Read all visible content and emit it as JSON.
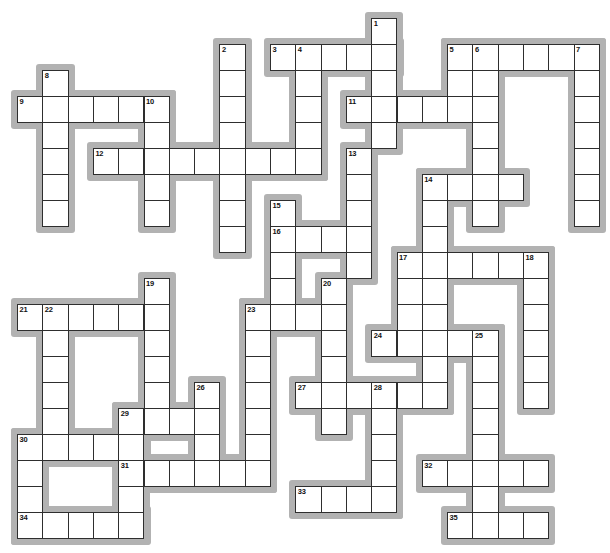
{
  "puzzle": {
    "kind": "crossword-grid",
    "grid": {
      "columns": 23,
      "rows": 20,
      "origin_x": 17,
      "origin_y": 18,
      "cell_width": 25.3,
      "cell_height": 26,
      "shadow_margin": 6,
      "colors": {
        "background": "#ffffff",
        "cell_fill": "#ffffff",
        "cell_border": "#2e2e2e",
        "run_shadow": "#b2b2b2",
        "number_text": "#111111"
      }
    },
    "words": [
      {
        "number": 3,
        "direction": "across",
        "col": 10,
        "row": 1,
        "length": 5
      },
      {
        "number": 5,
        "direction": "across",
        "col": 17,
        "row": 1,
        "length": 6
      },
      {
        "number": 9,
        "direction": "across",
        "col": 0,
        "row": 3,
        "length": 6
      },
      {
        "number": 11,
        "direction": "across",
        "col": 13,
        "row": 3,
        "length": 5
      },
      {
        "number": 12,
        "direction": "across",
        "col": 3,
        "row": 5,
        "length": 9
      },
      {
        "number": 14,
        "direction": "across",
        "col": 16,
        "row": 6,
        "length": 4
      },
      {
        "number": 16,
        "direction": "across",
        "col": 10,
        "row": 8,
        "length": 4
      },
      {
        "number": 17,
        "direction": "across",
        "col": 15,
        "row": 9,
        "length": 6
      },
      {
        "number": 21,
        "direction": "across",
        "col": 0,
        "row": 11,
        "length": 6
      },
      {
        "number": 23,
        "direction": "across",
        "col": 9,
        "row": 11,
        "length": 4
      },
      {
        "number": 24,
        "direction": "across",
        "col": 14,
        "row": 12,
        "length": 5
      },
      {
        "number": 27,
        "direction": "across",
        "col": 11,
        "row": 14,
        "length": 6
      },
      {
        "number": 29,
        "direction": "across",
        "col": 4,
        "row": 15,
        "length": 4
      },
      {
        "number": 30,
        "direction": "across",
        "col": 0,
        "row": 16,
        "length": 5
      },
      {
        "number": 31,
        "direction": "across",
        "col": 4,
        "row": 17,
        "length": 6
      },
      {
        "number": 32,
        "direction": "across",
        "col": 16,
        "row": 17,
        "length": 5
      },
      {
        "number": 33,
        "direction": "across",
        "col": 11,
        "row": 18,
        "length": 4
      },
      {
        "number": 34,
        "direction": "across",
        "col": 0,
        "row": 19,
        "length": 5
      },
      {
        "number": 35,
        "direction": "across",
        "col": 17,
        "row": 19,
        "length": 4
      },
      {
        "number": 1,
        "direction": "down",
        "col": 14,
        "row": 0,
        "length": 5
      },
      {
        "number": 2,
        "direction": "down",
        "col": 8,
        "row": 1,
        "length": 8
      },
      {
        "number": 4,
        "direction": "down",
        "col": 11,
        "row": 1,
        "length": 5
      },
      {
        "number": 5,
        "direction": "down",
        "col": 17,
        "row": 1,
        "length": 3
      },
      {
        "number": 6,
        "direction": "down",
        "col": 18,
        "row": 1,
        "length": 7
      },
      {
        "number": 7,
        "direction": "down",
        "col": 22,
        "row": 1,
        "length": 7
      },
      {
        "number": 8,
        "direction": "down",
        "col": 1,
        "row": 2,
        "length": 6
      },
      {
        "number": 10,
        "direction": "down",
        "col": 5,
        "row": 3,
        "length": 5
      },
      {
        "number": 13,
        "direction": "down",
        "col": 13,
        "row": 5,
        "length": 5
      },
      {
        "number": 14,
        "direction": "down",
        "col": 16,
        "row": 6,
        "length": 9
      },
      {
        "number": 15,
        "direction": "down",
        "col": 10,
        "row": 7,
        "length": 5
      },
      {
        "number": 17,
        "direction": "down",
        "col": 15,
        "row": 9,
        "length": 4
      },
      {
        "number": 18,
        "direction": "down",
        "col": 20,
        "row": 9,
        "length": 6
      },
      {
        "number": 19,
        "direction": "down",
        "col": 5,
        "row": 10,
        "length": 6
      },
      {
        "number": 20,
        "direction": "down",
        "col": 12,
        "row": 10,
        "length": 6
      },
      {
        "number": 22,
        "direction": "down",
        "col": 1,
        "row": 11,
        "length": 6
      },
      {
        "number": 23,
        "direction": "down",
        "col": 9,
        "row": 11,
        "length": 7
      },
      {
        "number": 25,
        "direction": "down",
        "col": 18,
        "row": 12,
        "length": 8
      },
      {
        "number": 26,
        "direction": "down",
        "col": 7,
        "row": 14,
        "length": 4
      },
      {
        "number": 28,
        "direction": "down",
        "col": 14,
        "row": 14,
        "length": 5
      },
      {
        "number": 29,
        "direction": "down",
        "col": 4,
        "row": 15,
        "length": 5
      },
      {
        "number": 30,
        "direction": "down",
        "col": 0,
        "row": 16,
        "length": 4
      }
    ],
    "numbers": [
      {
        "label": "1",
        "col": 14,
        "row": 0
      },
      {
        "label": "2",
        "col": 8,
        "row": 1
      },
      {
        "label": "3",
        "col": 10,
        "row": 1
      },
      {
        "label": "4",
        "col": 11,
        "row": 1
      },
      {
        "label": "5",
        "col": 17,
        "row": 1
      },
      {
        "label": "6",
        "col": 18,
        "row": 1
      },
      {
        "label": "7",
        "col": 22,
        "row": 1
      },
      {
        "label": "8",
        "col": 1,
        "row": 2
      },
      {
        "label": "9",
        "col": 0,
        "row": 3
      },
      {
        "label": "10",
        "col": 5,
        "row": 3
      },
      {
        "label": "11",
        "col": 13,
        "row": 3
      },
      {
        "label": "12",
        "col": 3,
        "row": 5
      },
      {
        "label": "13",
        "col": 13,
        "row": 5
      },
      {
        "label": "14",
        "col": 16,
        "row": 6
      },
      {
        "label": "15",
        "col": 10,
        "row": 7
      },
      {
        "label": "16",
        "col": 10,
        "row": 8
      },
      {
        "label": "17",
        "col": 15,
        "row": 9
      },
      {
        "label": "18",
        "col": 20,
        "row": 9
      },
      {
        "label": "19",
        "col": 5,
        "row": 10
      },
      {
        "label": "20",
        "col": 12,
        "row": 10
      },
      {
        "label": "21",
        "col": 0,
        "row": 11
      },
      {
        "label": "22",
        "col": 1,
        "row": 11
      },
      {
        "label": "23",
        "col": 9,
        "row": 11
      },
      {
        "label": "24",
        "col": 14,
        "row": 12
      },
      {
        "label": "25",
        "col": 18,
        "row": 12
      },
      {
        "label": "26",
        "col": 7,
        "row": 14
      },
      {
        "label": "27",
        "col": 11,
        "row": 14
      },
      {
        "label": "28",
        "col": 14,
        "row": 14
      },
      {
        "label": "29",
        "col": 4,
        "row": 15
      },
      {
        "label": "30",
        "col": 0,
        "row": 16
      },
      {
        "label": "31",
        "col": 4,
        "row": 17
      },
      {
        "label": "32",
        "col": 16,
        "row": 17
      },
      {
        "label": "33",
        "col": 11,
        "row": 18
      },
      {
        "label": "34",
        "col": 0,
        "row": 19
      },
      {
        "label": "35",
        "col": 17,
        "row": 19
      }
    ]
  }
}
